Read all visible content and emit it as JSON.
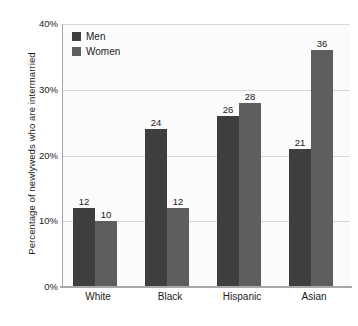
{
  "chart_data": {
    "type": "bar",
    "title": "",
    "subtitle": "",
    "xlabel": "",
    "ylabel": "Percentage of newlyweds who are intermarried",
    "categories": [
      "White",
      "Black",
      "Hispanic",
      "Asian"
    ],
    "series": [
      {
        "name": "Men",
        "values": [
          12,
          24,
          26,
          21
        ],
        "color": "#3f3f3f"
      },
      {
        "name": "Women",
        "values": [
          10,
          12,
          28,
          36
        ],
        "color": "#5e5e5e"
      }
    ],
    "ylim": [
      0,
      40
    ],
    "ytick_values": [
      0,
      10,
      20,
      30,
      40
    ],
    "ytick_labels": [
      "0%",
      "10%",
      "20%",
      "30%",
      "40%"
    ],
    "grid": true,
    "legend_position": "top-left",
    "value_labels": true,
    "value_label_suffix": "",
    "plot_background": "#fbfbfb",
    "gridline_color": "#d6d6d6",
    "axis_color": "#a8a8a8",
    "text_color": "#1a1a1a"
  },
  "legend": {
    "items": [
      {
        "label": "Men",
        "swatch_name": "legend-swatch-men"
      },
      {
        "label": "Women",
        "swatch_name": "legend-swatch-women"
      }
    ]
  }
}
